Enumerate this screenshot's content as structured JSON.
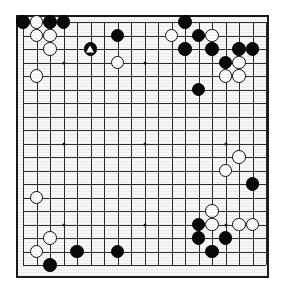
{
  "board": {
    "name": "go-board",
    "size": 19,
    "grid_spacing": 13.5,
    "origin_x": 5,
    "origin_y": 5,
    "colors": {
      "board_background": "#f7f7f5",
      "line": "#2b2b2b",
      "border": "#1a1a1a",
      "black_stone": "#0a0a0a",
      "white_stone": "#fdfdfb",
      "white_stone_edge": "#0d0d0d",
      "page_background": "#ffffff"
    },
    "star_points": [
      {
        "col": 4,
        "row": 4
      },
      {
        "col": 10,
        "row": 4
      },
      {
        "col": 16,
        "row": 4
      },
      {
        "col": 4,
        "row": 10
      },
      {
        "col": 10,
        "row": 10
      },
      {
        "col": 16,
        "row": 10
      },
      {
        "col": 4,
        "row": 16
      },
      {
        "col": 10,
        "row": 16
      },
      {
        "col": 16,
        "row": 16
      }
    ],
    "stones": [
      {
        "col": 1,
        "row": 1,
        "color": "black",
        "mark": null
      },
      {
        "col": 2,
        "row": 1,
        "color": "white",
        "mark": null
      },
      {
        "col": 3,
        "row": 1,
        "color": "black",
        "mark": null
      },
      {
        "col": 4,
        "row": 1,
        "color": "black",
        "mark": null
      },
      {
        "col": 2,
        "row": 2,
        "color": "white",
        "mark": null
      },
      {
        "col": 3,
        "row": 2,
        "color": "white",
        "mark": null
      },
      {
        "col": 3,
        "row": 3,
        "color": "white",
        "mark": null
      },
      {
        "col": 6,
        "row": 3,
        "color": "black",
        "mark": "triangle"
      },
      {
        "col": 8,
        "row": 2,
        "color": "black",
        "mark": null
      },
      {
        "col": 8,
        "row": 4,
        "color": "white",
        "mark": null
      },
      {
        "col": 2,
        "row": 5,
        "color": "white",
        "mark": null
      },
      {
        "col": 13,
        "row": 1,
        "color": "black",
        "mark": null
      },
      {
        "col": 12,
        "row": 2,
        "color": "white",
        "mark": null
      },
      {
        "col": 14,
        "row": 2,
        "color": "black",
        "mark": null
      },
      {
        "col": 15,
        "row": 2,
        "color": "white",
        "mark": null
      },
      {
        "col": 13,
        "row": 3,
        "color": "black",
        "mark": null
      },
      {
        "col": 15,
        "row": 3,
        "color": "black",
        "mark": null
      },
      {
        "col": 17,
        "row": 3,
        "color": "black",
        "mark": null
      },
      {
        "col": 18,
        "row": 3,
        "color": "black",
        "mark": null
      },
      {
        "col": 16,
        "row": 4,
        "color": "black",
        "mark": null
      },
      {
        "col": 17,
        "row": 4,
        "color": "white",
        "mark": null
      },
      {
        "col": 16,
        "row": 5,
        "color": "white",
        "mark": null
      },
      {
        "col": 17,
        "row": 5,
        "color": "white",
        "mark": null
      },
      {
        "col": 14,
        "row": 6,
        "color": "black",
        "mark": null
      },
      {
        "col": 17,
        "row": 11,
        "color": "white",
        "mark": null
      },
      {
        "col": 16,
        "row": 12,
        "color": "white",
        "mark": null
      },
      {
        "col": 18,
        "row": 13,
        "color": "black",
        "mark": null
      },
      {
        "col": 2,
        "row": 14,
        "color": "white",
        "mark": null
      },
      {
        "col": 15,
        "row": 15,
        "color": "white",
        "mark": null
      },
      {
        "col": 14,
        "row": 16,
        "color": "black",
        "mark": null
      },
      {
        "col": 15,
        "row": 16,
        "color": "white",
        "mark": null
      },
      {
        "col": 17,
        "row": 16,
        "color": "white",
        "mark": null
      },
      {
        "col": 18,
        "row": 16,
        "color": "white",
        "mark": null
      },
      {
        "col": 14,
        "row": 17,
        "color": "black",
        "mark": null
      },
      {
        "col": 16,
        "row": 17,
        "color": "black",
        "mark": null
      },
      {
        "col": 3,
        "row": 17,
        "color": "white",
        "mark": null
      },
      {
        "col": 2,
        "row": 18,
        "color": "white",
        "mark": null
      },
      {
        "col": 5,
        "row": 18,
        "color": "black",
        "mark": null
      },
      {
        "col": 8,
        "row": 18,
        "color": "black",
        "mark": null
      },
      {
        "col": 15,
        "row": 18,
        "color": "black",
        "mark": null
      },
      {
        "col": 3,
        "row": 19,
        "color": "black",
        "mark": null
      }
    ]
  }
}
